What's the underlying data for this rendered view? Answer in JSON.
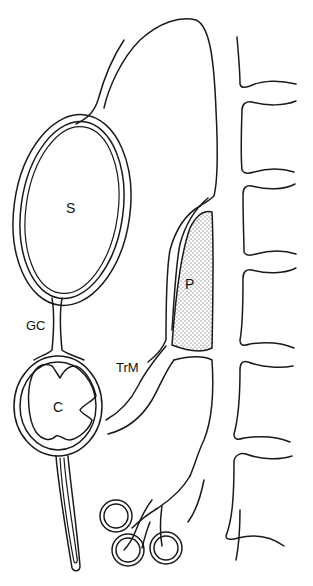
{
  "diagram": {
    "type": "anatomical line drawing",
    "colors": {
      "stroke": "#1a1a1a",
      "background": "#ffffff",
      "stipple": "#333333"
    },
    "labels": {
      "S": "S",
      "P": "P",
      "GC": "GC",
      "C": "C",
      "TrM": "TrM"
    },
    "structures": [
      {
        "id": "S",
        "description": "large oval chamber with double wall, upper left"
      },
      {
        "id": "GC",
        "description": "narrow duct connecting S to C"
      },
      {
        "id": "C",
        "description": "rounded chamber with notched inner lumen, lower left, with long tail stalk"
      },
      {
        "id": "P",
        "description": "stippled elongated body, center right"
      },
      {
        "id": "TrM",
        "description": "tube connecting C region to P region"
      },
      {
        "id": "large-sac",
        "description": "large outline enclosing P, top center"
      },
      {
        "id": "vertebrae",
        "description": "segmented column at right edge"
      },
      {
        "id": "ring-cluster",
        "description": "three small looped rings at bottom center"
      }
    ]
  }
}
